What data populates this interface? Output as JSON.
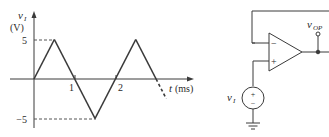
{
  "graph": {
    "y_axis_label_var": "v",
    "y_axis_label_sub": "I",
    "y_axis_unit": "(V)",
    "x_axis_label_var": "t",
    "x_axis_unit": "(ms)",
    "y_tick_pos": "5",
    "y_tick_neg": "−5",
    "x_tick_1": "1",
    "x_tick_2": "2"
  },
  "chart_data": {
    "type": "line",
    "title": "",
    "xlabel": "t (ms)",
    "ylabel": "v_I (V)",
    "x": [
      0,
      0.5,
      1,
      1.5,
      2,
      2.5,
      3,
      3.25
    ],
    "series": [
      {
        "name": "v_I",
        "values": [
          0,
          5,
          0,
          -5,
          0,
          5,
          0,
          -2.5
        ]
      }
    ],
    "x_ticks": [
      1,
      2
    ],
    "y_ticks": [
      5,
      -5
    ],
    "ylim": [
      -5,
      5
    ],
    "note": "segment from t=3 onward drawn dashed (continuation)"
  },
  "circuit": {
    "input_label_var": "v",
    "input_label_sub": "I",
    "output_label_var": "v",
    "output_label_sub": "OP",
    "inverting_sign": "−",
    "noninverting_sign": "+",
    "source_plus": "+",
    "source_minus": "−",
    "colors": {
      "line": "#3a3a3a"
    }
  }
}
